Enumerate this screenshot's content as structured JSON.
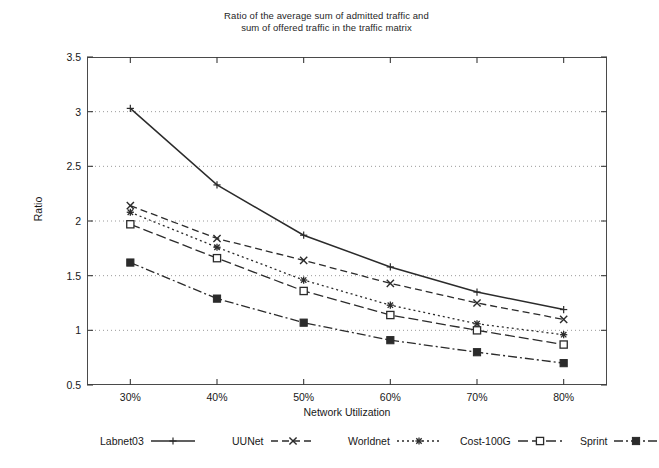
{
  "chart_data": {
    "type": "line",
    "title": "Ratio of the average sum of admitted traffic and sum of offered traffic in the traffic matrix",
    "title_lines": [
      "Ratio of the average sum of admitted traffic and",
      "sum of offered traffic in the traffic matrix"
    ],
    "xlabel": "Network Utilization",
    "ylabel": "Ratio",
    "categories": [
      "30%",
      "40%",
      "50%",
      "60%",
      "70%",
      "80%"
    ],
    "x": [
      30,
      40,
      50,
      60,
      70,
      80
    ],
    "xlim": [
      25,
      85
    ],
    "ylim": [
      0.5,
      3.5
    ],
    "ytick_labels": [
      "0.5",
      "1",
      "1.5",
      "2",
      "2.5",
      "3",
      "3.5"
    ],
    "yticks": [
      0.5,
      1,
      1.5,
      2,
      2.5,
      3,
      3.5
    ],
    "grid": "horizontal-dotted",
    "legend_position": "bottom-outside",
    "series": [
      {
        "name": "Labnet03",
        "values": [
          3.03,
          2.33,
          1.87,
          1.58,
          1.35,
          1.19
        ],
        "marker": "plus",
        "dash": "solid",
        "color": "#2b2b2b"
      },
      {
        "name": "UUNet",
        "values": [
          2.14,
          1.84,
          1.64,
          1.43,
          1.25,
          1.1
        ],
        "marker": "cross",
        "dash": "dashed",
        "color": "#2b2b2b"
      },
      {
        "name": "Worldnet",
        "values": [
          2.08,
          1.76,
          1.46,
          1.23,
          1.06,
          0.96
        ],
        "marker": "star",
        "dash": "dotted",
        "color": "#2b2b2b"
      },
      {
        "name": "Cost-100G",
        "values": [
          1.97,
          1.66,
          1.36,
          1.14,
          1.0,
          0.87
        ],
        "marker": "open-square",
        "dash": "long-dash",
        "color": "#2b2b2b"
      },
      {
        "name": "Sprint",
        "values": [
          1.62,
          1.29,
          1.07,
          0.91,
          0.8,
          0.7
        ],
        "marker": "filled-square",
        "dash": "dash-dot",
        "color": "#2b2b2b"
      }
    ]
  },
  "legend": {
    "items": [
      {
        "label": "Labnet03"
      },
      {
        "label": "UUNet"
      },
      {
        "label": "Worldnet"
      },
      {
        "label": "Cost-100G"
      },
      {
        "label": "Sprint"
      }
    ]
  }
}
